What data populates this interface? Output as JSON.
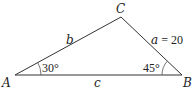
{
  "diagram": {
    "type": "triangle",
    "vertices": {
      "A": {
        "label": "A",
        "x": 15,
        "y": 75
      },
      "B": {
        "label": "B",
        "x": 182,
        "y": 75
      },
      "C": {
        "label": "C",
        "x": 121,
        "y": 17
      }
    },
    "sides": {
      "a": {
        "label_var": "a",
        "label_eq": " = 20",
        "value": 20,
        "between": [
          "B",
          "C"
        ]
      },
      "b": {
        "label_var": "b",
        "between": [
          "A",
          "C"
        ]
      },
      "c": {
        "label_var": "c",
        "between": [
          "A",
          "B"
        ]
      }
    },
    "angles": {
      "A": {
        "label": "30°",
        "degrees": 30
      },
      "B": {
        "label": "45°",
        "degrees": 45
      }
    },
    "colors": {
      "line": "#333333",
      "text": "#222222",
      "background": "#ffffff"
    }
  }
}
